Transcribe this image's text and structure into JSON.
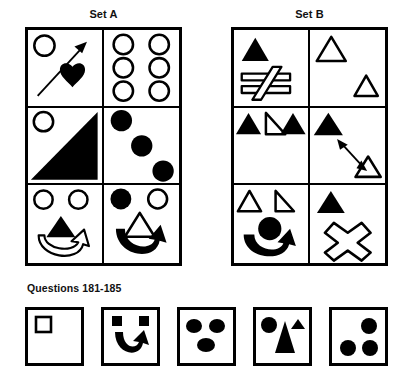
{
  "page": {
    "background": "#ffffff",
    "ink": "#000000",
    "width": 410,
    "height": 387
  },
  "headings": {
    "set_a": "Set A",
    "set_b": "Set B",
    "questions": "Questions 181-185"
  },
  "sets": [
    {
      "id": "set-a",
      "label": "Set A",
      "cells": [
        {
          "index": 1,
          "name": "set-a-cell-1",
          "description": "outlined circle top-left, long diagonal arrow pointing up-right, solid black heart",
          "shapes": [
            "circle-outline",
            "diagonal-arrow-up-right",
            "heart-filled"
          ]
        },
        {
          "index": 2,
          "name": "set-a-cell-2",
          "description": "six outlined circles arranged in three rows of two",
          "shapes": [
            "circle-outline",
            "circle-outline",
            "circle-outline",
            "circle-outline",
            "circle-outline",
            "circle-outline"
          ]
        },
        {
          "index": 3,
          "name": "set-a-cell-3",
          "description": "outlined circle top-left, large solid black right triangle filling the cell",
          "shapes": [
            "circle-outline",
            "right-triangle-filled"
          ]
        },
        {
          "index": 4,
          "name": "set-a-cell-4",
          "description": "three solid black circles on a descending diagonal",
          "shapes": [
            "circle-filled",
            "circle-filled",
            "circle-filled"
          ]
        },
        {
          "index": 5,
          "name": "set-a-cell-5",
          "description": "two outlined circles on top, solid black triangle, outlined curved arrow sweeping right",
          "shapes": [
            "circle-outline",
            "circle-outline",
            "triangle-filled",
            "curved-arrow-outline"
          ]
        },
        {
          "index": 6,
          "name": "set-a-cell-6",
          "description": "solid black circle and outlined circle on top, outlined triangle, solid black curved arrow sweeping right",
          "shapes": [
            "circle-filled",
            "circle-outline",
            "triangle-outline",
            "curved-arrow-filled"
          ]
        }
      ]
    },
    {
      "id": "set-b",
      "label": "Set B",
      "cells": [
        {
          "index": 1,
          "name": "set-b-cell-1",
          "description": "solid black triangle top-left, outlined not-equals sign below",
          "shapes": [
            "triangle-filled",
            "not-equals-outline"
          ]
        },
        {
          "index": 2,
          "name": "set-b-cell-2",
          "description": "outlined triangle top-left, smaller outlined triangle bottom-right",
          "shapes": [
            "triangle-outline",
            "triangle-outline"
          ]
        },
        {
          "index": 3,
          "name": "set-b-cell-3",
          "description": "solid black triangle, outlined right triangle, solid black triangle in a row",
          "shapes": [
            "triangle-filled",
            "right-triangle-outline",
            "triangle-filled"
          ]
        },
        {
          "index": 4,
          "name": "set-b-cell-4",
          "description": "solid black triangle top-left, double-headed diagonal arrow, outlined triangle bottom-right",
          "shapes": [
            "triangle-filled",
            "double-headed-arrow",
            "triangle-outline"
          ]
        },
        {
          "index": 5,
          "name": "set-b-cell-5",
          "description": "outlined triangle and outlined right triangle on top, solid black circle, solid black curved arrow sweeping right",
          "shapes": [
            "triangle-outline",
            "right-triangle-outline",
            "circle-filled",
            "curved-arrow-filled"
          ]
        },
        {
          "index": 6,
          "name": "set-b-cell-6",
          "description": "solid black triangle top-left, outlined X cross symbol",
          "shapes": [
            "triangle-filled",
            "x-cross-outline"
          ]
        }
      ]
    }
  ],
  "answers": [
    {
      "index": 1,
      "name": "answer-option-1",
      "description": "small outlined square in the upper-left of an empty box",
      "shapes": [
        "square-outline"
      ]
    },
    {
      "index": 2,
      "name": "answer-option-2",
      "description": "two small solid squares on top, solid black curved arrow sweeping right",
      "shapes": [
        "square-filled",
        "square-filled",
        "curved-arrow-filled"
      ]
    },
    {
      "index": 3,
      "name": "answer-option-3",
      "description": "three solid black ellipses, two on top and one below centre",
      "shapes": [
        "ellipse-filled",
        "ellipse-filled",
        "ellipse-filled"
      ]
    },
    {
      "index": 4,
      "name": "answer-option-4",
      "description": "solid black circle, tall solid black triangle, small solid black triangle",
      "shapes": [
        "circle-filled",
        "triangle-filled-tall",
        "triangle-filled-small"
      ]
    },
    {
      "index": 5,
      "name": "answer-option-5",
      "description": "three solid black circles at upper-right, lower-left and lower-right",
      "shapes": [
        "circle-filled",
        "circle-filled",
        "circle-filled"
      ]
    }
  ]
}
